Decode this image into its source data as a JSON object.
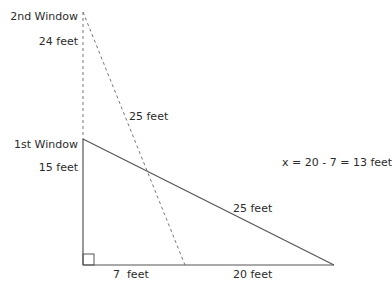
{
  "diagram": {
    "labels": {
      "second_window": "2nd Window",
      "first_window": "1st Window",
      "upper_wall_segment": "24 feet",
      "lower_wall_segment": "15 feet",
      "ladder_long_dashed": "25 feet",
      "ladder_solid": "25 feet",
      "base_short": "7  feet",
      "base_long": "20 feet",
      "equation": "x = 20 - 7 = 13 feet"
    },
    "colors": {
      "line": "#555555",
      "dashed": "#777777",
      "text": "#2b2b2b"
    }
  }
}
